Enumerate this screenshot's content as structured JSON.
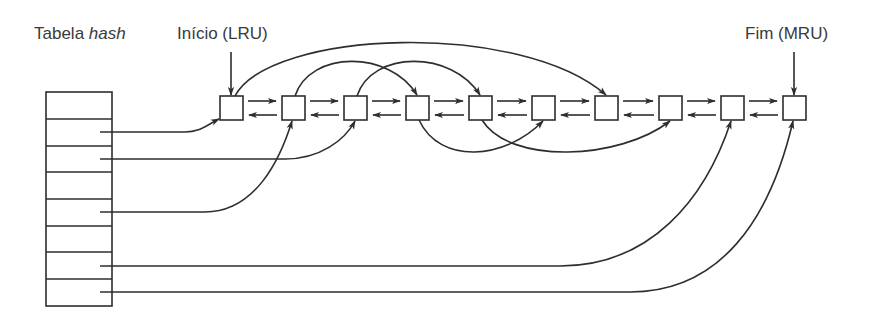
{
  "labels": {
    "hash_table_prefix": "Tabela ",
    "hash_table_italic": "hash",
    "head": "Início (LRU)",
    "tail": "Fim (MRU)"
  },
  "hash_table": {
    "rows": 8,
    "pointer_rows": [
      2,
      3,
      5,
      7,
      8
    ]
  },
  "list": {
    "node_count": 10,
    "doubly_linked": true
  },
  "hash_pointers": [
    {
      "row": 2,
      "to_node": 1
    },
    {
      "row": 3,
      "to_node": 3
    },
    {
      "row": 5,
      "to_node": 2
    },
    {
      "row": 7,
      "to_node": 9
    },
    {
      "row": 8,
      "to_node": 10
    }
  ],
  "chain_links": [
    {
      "from_node": 1,
      "to_node": 7,
      "side": "top"
    },
    {
      "from_node": 2,
      "to_node": 4,
      "side": "top"
    },
    {
      "from_node": 3,
      "to_node": 5,
      "side": "top"
    },
    {
      "from_node": 4,
      "to_node": 6,
      "side": "bottom"
    },
    {
      "from_node": 5,
      "to_node": 8,
      "side": "bottom"
    }
  ],
  "colors": {
    "stroke": "#2e2e2e",
    "text": "#3a3a3a",
    "background": "#ffffff"
  }
}
